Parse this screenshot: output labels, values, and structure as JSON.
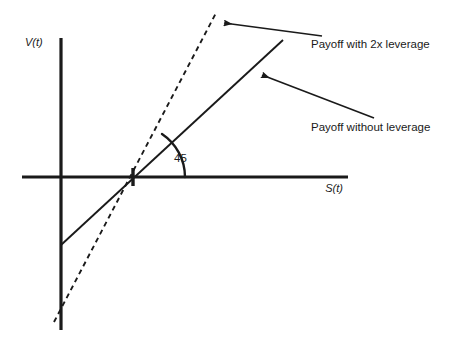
{
  "figure": {
    "background_color": "#ffffff",
    "stroke_color": "#1a1a1a",
    "width": 454,
    "height": 344
  },
  "axes": {
    "y_axis": {
      "label": "V(t)",
      "x": 61,
      "y_top": 38,
      "y_bottom": 330,
      "label_x": 25,
      "label_y": 46
    },
    "x_axis": {
      "label": "S(t)",
      "y": 177,
      "x_left": 22,
      "x_right": 348,
      "label_x": 334,
      "label_y": 192
    },
    "origin": {
      "x": 61,
      "y": 177
    }
  },
  "tick": {
    "name": "strike-tick",
    "x": 133,
    "y": 177,
    "half_height": 9
  },
  "series": [
    {
      "name": "payoff-with-leverage",
      "label": "Payoff with 2x leverage",
      "style": "dashed",
      "dash_pattern": "5,4",
      "x1": 54,
      "y1": 322,
      "x2": 216,
      "y2": 13,
      "slope_description": "2x steeper line through the strike point"
    },
    {
      "name": "payoff-without-leverage",
      "label": "Payoff without leverage",
      "style": "solid",
      "x1": 61,
      "y1": 245,
      "x2": 283,
      "y2": 40,
      "slope_description": "45 degree line through the strike point"
    }
  ],
  "annotations": [
    {
      "name": "leverage-annotation",
      "text": "Payoff with 2x leverage",
      "text_x": 311,
      "text_y": 48,
      "arrow": {
        "tail_x": 322,
        "tail_y": 36,
        "tip_x": 222,
        "tip_y": 23
      }
    },
    {
      "name": "no-leverage-annotation",
      "text": "Payoff without leverage",
      "text_x": 311,
      "text_y": 131,
      "arrow": {
        "tail_x": 374,
        "tail_y": 118,
        "tip_x": 260,
        "tip_y": 74
      }
    }
  ],
  "angle": {
    "name": "forty-five-degree-angle",
    "value": "45",
    "label_x": 174,
    "label_y": 162,
    "arc_path": "M 185 177 A 52 52 0 0 0 162 134",
    "vertex_x": 133,
    "vertex_y": 177
  }
}
